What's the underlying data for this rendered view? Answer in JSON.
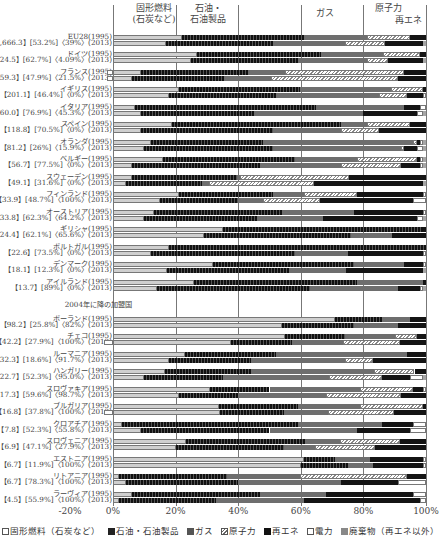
{
  "chart_data": {
    "type": "bar",
    "orientation": "horizontal-stacked-100",
    "title": "",
    "xlabel": "",
    "xlim": [
      -20,
      100
    ],
    "x_ticks": [
      "-20%",
      "0%",
      "20%",
      "40%",
      "60%",
      "80%",
      "100%"
    ],
    "grid": true,
    "column_headers": [
      {
        "label": "固形燃料\n(石炭など)",
        "x": 0
      },
      {
        "label": "石油・\n石油製品",
        "x": 20
      },
      {
        "label": "ガス",
        "x": 60
      },
      {
        "label": "原子力",
        "x": 80
      },
      {
        "label": "再エネ",
        "x": 100
      }
    ],
    "legend": [
      {
        "name": "固形燃料（石炭など）",
        "color": "#c8c8c8",
        "pattern": "solid-light"
      },
      {
        "name": "石油・石油製品",
        "color": "#1a1a1a",
        "pattern": "dotted-dark"
      },
      {
        "name": "ガス",
        "color": "#6e6e6e",
        "pattern": "solid-mid"
      },
      {
        "name": "原子力",
        "color": "#e6e6e6",
        "pattern": "hatched"
      },
      {
        "name": "再エネ",
        "color": "#111111",
        "pattern": "solid-dark"
      },
      {
        "name": "電力",
        "color": "#ffffff",
        "pattern": "outline"
      },
      {
        "name": "廃棄物（再エネ以外）",
        "color": "#9a9a9a",
        "pattern": "solid-grey"
      }
    ],
    "series_order": [
      "solid",
      "oil",
      "gas",
      "nuclear",
      "renew",
      "elec",
      "waste"
    ],
    "rows": [
      {
        "label": "EU28(1995)",
        "y": 37,
        "values": [
          22,
          39,
          20,
          14,
          5,
          0,
          0
        ]
      },
      {
        "label": "【1,666.3】[53.2%]〈39%〉(2013)",
        "y": 43,
        "values": [
          17,
          34,
          23,
          13,
          12,
          0,
          1
        ]
      },
      {
        "label": "ドイツ(1995)",
        "y": 54,
        "values": [
          27,
          40,
          20,
          12,
          2,
          0,
          0
        ]
      },
      {
        "label": "【324.5】[62.7%]〈4.09%〉(2013)",
        "y": 60,
        "values": [
          25,
          34,
          22,
          7,
          11,
          0,
          1
        ]
      },
      {
        "label": "フランス(1995)",
        "y": 72,
        "values": [
          9,
          34,
          12,
          38,
          7,
          -2,
          0
        ]
      },
      {
        "label": "【259.3】[47.9%]〈21.5%〉(2013)",
        "y": 78,
        "values": [
          6,
          29,
          15,
          40,
          9,
          -2,
          0
        ]
      },
      {
        "label": "イギリス(1995)",
        "y": 89,
        "values": [
          21,
          38,
          29,
          10,
          1,
          0,
          0
        ]
      },
      {
        "label": "【201.1】[46.4%]〈0%〉(2013)",
        "y": 95,
        "values": [
          18,
          34,
          33,
          9,
          5,
          1,
          0
        ]
      },
      {
        "label": "イタリア(1995)",
        "y": 107,
        "values": [
          7,
          58,
          28,
          0,
          5,
          2,
          0
        ]
      },
      {
        "label": "【160.0】[76.9%]〈45.3%〉(2013)",
        "y": 113,
        "values": [
          9,
          36,
          35,
          0,
          17,
          2,
          1
        ]
      },
      {
        "label": "スペイン(1995)",
        "y": 124,
        "values": [
          19,
          54,
          8,
          14,
          5,
          0,
          0
        ]
      },
      {
        "label": "【118.8】[70.5%]〈0%〉(2013)",
        "y": 130,
        "values": [
          9,
          42,
          22,
          12,
          15,
          0,
          0
        ]
      },
      {
        "label": "オランダ(1995)",
        "y": 142,
        "values": [
          12,
          36,
          48,
          1,
          1,
          1,
          1
        ]
      },
      {
        "label": "【81.2】[26%]〈15.9%〉(2013)",
        "y": 148,
        "values": [
          10,
          41,
          41,
          1,
          4,
          2,
          1
        ]
      },
      {
        "label": "ベルギー(1995)",
        "y": 159,
        "values": [
          16,
          42,
          20,
          19,
          1,
          1,
          1
        ]
      },
      {
        "label": "【56.7】[77.5%]〈0%〉(2013)",
        "y": 165,
        "values": [
          6,
          41,
          26,
          19,
          6,
          1,
          1
        ]
      },
      {
        "label": "スウェーデン(1995)",
        "y": 177,
        "values": [
          6,
          34,
          1,
          35,
          25,
          0,
          0
        ]
      },
      {
        "label": "【49.1】[31.6%]〈0%〉(2013)",
        "y": 183,
        "values": [
          4,
          24,
          2,
          33,
          34,
          0,
          1
        ]
      },
      {
        "label": "フィンランド(1995)",
        "y": 194,
        "values": [
          21,
          30,
          10,
          17,
          21,
          1,
          0
        ]
      },
      {
        "label": "【33.9】[48.7%]〈100%〉(2013)",
        "y": 200,
        "values": [
          15,
          25,
          8,
          18,
          30,
          4,
          0
        ]
      },
      {
        "label": "オーストリア(1995)",
        "y": 212,
        "values": [
          13,
          41,
          23,
          0,
          22,
          1,
          0
        ]
      },
      {
        "label": "【33.8】[62.3%]〈64.2%〉(2013)",
        "y": 218,
        "values": [
          10,
          36,
          21,
          0,
          30,
          2,
          1
        ]
      },
      {
        "label": "ギリシャ(1995)",
        "y": 229,
        "values": [
          35,
          64,
          0,
          0,
          1,
          0,
          0
        ]
      },
      {
        "label": "【24.4】[62.1%]〈65.6%〉(2013)",
        "y": 235,
        "values": [
          29,
          47,
          13,
          0,
          11,
          0,
          0
        ]
      },
      {
        "label": "ポルトガル(1995)",
        "y": 247,
        "values": [
          18,
          82,
          0,
          0,
          0,
          0,
          0
        ]
      },
      {
        "label": "【22.6】[73.5%]〈0%〉(2013)",
        "y": 253,
        "values": [
          12,
          46,
          17,
          0,
          24,
          1,
          0
        ]
      },
      {
        "label": "デンマーク(1995)",
        "y": 264,
        "values": [
          32,
          45,
          16,
          0,
          6,
          1,
          0
        ]
      },
      {
        "label": "【18.1】[12.3%]〈0%〉(2013)",
        "y": 270,
        "values": [
          17,
          38,
          18,
          0,
          24,
          0,
          1
        ]
      },
      {
        "label": "アイルランド(1995)",
        "y": 282,
        "values": [
          26,
          52,
          21,
          0,
          1,
          0,
          0
        ]
      },
      {
        "label": "【13.7】[89%]〈0%〉(2013)",
        "y": 288,
        "values": [
          14,
          49,
          28,
          0,
          7,
          1,
          1
        ]
      },
      {
        "label": "2004年に降の加盟国",
        "y": 305,
        "group_header": true
      },
      {
        "label": "ポーランド(1995)",
        "y": 319,
        "values": [
          71,
          15,
          9,
          0,
          5,
          0,
          0
        ]
      },
      {
        "label": "【98.2】[25.8%]〈82%〉(2013)",
        "y": 325,
        "values": [
          54,
          23,
          14,
          0,
          9,
          0,
          0
        ]
      },
      {
        "label": "チェコ(1995)",
        "y": 336,
        "values": [
          55,
          19,
          16,
          7,
          3,
          0,
          0
        ]
      },
      {
        "label": "【42.2】[27.9%]〈100%〉(2013)",
        "y": 342,
        "values": [
          37,
          19,
          16,
          18,
          8,
          -3,
          0
        ]
      },
      {
        "label": "ルーマニア(1995)",
        "y": 354,
        "values": [
          23,
          29,
          42,
          0,
          6,
          0,
          0
        ]
      },
      {
        "label": "【32.3】[18.6%]〈91.7%〉(2013)",
        "y": 360,
        "values": [
          18,
          26,
          30,
          9,
          17,
          0,
          0
        ]
      },
      {
        "label": "ハンガリー(1995)",
        "y": 371,
        "values": [
          18,
          30,
          43,
          14,
          4,
          0,
          0
        ]
      },
      {
        "label": "【22.7】[52.3%]〈95.0%〉(2013)",
        "y": 377,
        "values": [
          10,
          25,
          34,
          17,
          9,
          4,
          1
        ]
      },
      {
        "label": "スロヴァキア(1995)",
        "y": 389,
        "values": [
          31,
          19,
          29,
          17,
          3,
          1,
          0
        ]
      },
      {
        "label": "【17.3】[59.6%]〈98.7%〉(2013)",
        "y": 395,
        "values": [
          21,
          19,
          28,
          24,
          8,
          0,
          0
        ]
      },
      {
        "label": "ブルガリア(1995)",
        "y": 406,
        "values": [
          34,
          25,
          20,
          20,
          1,
          0,
          0
        ]
      },
      {
        "label": "【16.8】[37.8%]〈100%〉(2013)",
        "y": 412,
        "values": [
          34,
          20,
          14,
          21,
          10,
          -3,
          0
        ]
      },
      {
        "label": "クロアチア(1995)",
        "y": 424,
        "values": [
          3,
          56,
          27,
          0,
          10,
          4,
          0
        ]
      },
      {
        "label": "【7.8】[52.3%]〈55.8%〉(2013)",
        "y": 430,
        "values": [
          9,
          41,
          28,
          0,
          17,
          5,
          0
        ]
      },
      {
        "label": "スロヴェニア(1995)",
        "y": 441,
        "values": [
          23,
          37,
          11,
          19,
          8,
          0,
          0
        ]
      },
      {
        "label": "【6.9】[47.1%]〈27.9%〉(2013)",
        "y": 447,
        "values": [
          20,
          34,
          10,
          19,
          16,
          0,
          0
        ]
      },
      {
        "label": "エストニア(1995)",
        "y": 459,
        "values": [
          61,
          0,
          0,
          0,
          0,
          0,
          0
        ],
        "note": "oil shale counted with solid; remaining: 60-100 split"
      },
      {
        "label": "【6.7】[11.9%]〈100%〉(2013)",
        "y": 465,
        "values": [
          60,
          15,
          8,
          0,
          16,
          1,
          0
        ]
      },
      {
        "label": "リトアニア(1995)",
        "y": 476,
        "values": [
          2,
          34,
          23,
          34,
          6,
          0,
          0
        ]
      },
      {
        "label": "【6.7】[78.3%]〈100%〉(2013)",
        "y": 482,
        "values": [
          4,
          36,
          33,
          0,
          18,
          9,
          0
        ]
      },
      {
        "label": "ラーヴィア(1995)",
        "y": 494,
        "values": [
          6,
          41,
          21,
          0,
          28,
          4,
          0
        ]
      },
      {
        "label": "【4.5】[55.9%]〈100%〉(2013)",
        "y": 500,
        "values": [
          2,
          31,
          28,
          0,
          37,
          2,
          0
        ]
      }
    ]
  },
  "legend_text": [
    "固形燃料（石炭など）",
    "石油・石油製品",
    "ガス",
    "原子力",
    "再エネ",
    "電力",
    "廃棄物（再エネ以外）"
  ]
}
